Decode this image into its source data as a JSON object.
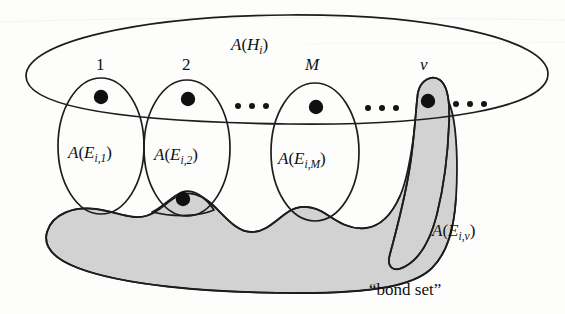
{
  "figure": {
    "outer_set": {
      "label_prefix": "A",
      "label_open": "(",
      "label_base": "H",
      "label_sub": "i",
      "label_close": ")",
      "label_full": "A(Hᵢ)"
    },
    "index_labels": [
      {
        "id": "index-1",
        "text": "1",
        "x": 100,
        "y": 70
      },
      {
        "id": "index-2",
        "text": "2",
        "x": 186,
        "y": 70
      },
      {
        "id": "index-M",
        "text": "M",
        "x": 313,
        "y": 70
      },
      {
        "id": "index-nu",
        "text": "ν",
        "x": 425,
        "y": 70
      }
    ],
    "subsets": [
      {
        "id": "subset-1",
        "prefix": "A",
        "open": "(",
        "base": "E",
        "sub": "i,1",
        "close": ")",
        "full": "A(Eᵢ,₁)",
        "shaded": false
      },
      {
        "id": "subset-2",
        "prefix": "A",
        "open": "(",
        "base": "E",
        "sub": "i,2",
        "close": ")",
        "full": "A(Eᵢ,₂)",
        "shaded": false
      },
      {
        "id": "subset-M",
        "prefix": "A",
        "open": "(",
        "base": "E",
        "sub": "i,M",
        "close": ")",
        "full": "A(Eᵢ,ₘ)",
        "shaded": false
      },
      {
        "id": "subset-nu",
        "prefix": "A",
        "open": "(",
        "base": "E",
        "sub": "i,ν",
        "close": ")",
        "full": "A(Eᵢ,ν)",
        "shaded": true
      }
    ],
    "ellipsis_groups": [
      {
        "id": "ellipsis-mid",
        "dots": 3
      },
      {
        "id": "ellipsis-right-of-M",
        "dots": 3
      },
      {
        "id": "ellipsis-far-right",
        "dots": 3
      }
    ],
    "caption": {
      "text": "“bond set”"
    },
    "colors": {
      "ink": "#1d1d1d",
      "shade": "#d2d2d2",
      "paper": "#fdfdfc",
      "dot": "#101010"
    }
  }
}
